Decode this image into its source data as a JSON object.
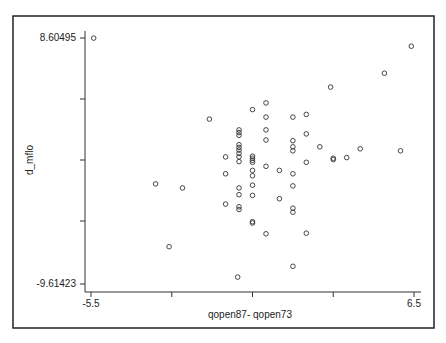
{
  "chart_data": {
    "type": "scatter",
    "title": "",
    "xlabel": "qopen87- qopen73",
    "ylabel": "d_mflo",
    "xlim": [
      -5.5,
      6.5
    ],
    "ylim": [
      -9.61423,
      8.60495
    ],
    "x_tick_labels": [
      "-5.5",
      "6.5"
    ],
    "x_ticks": [
      -5.5,
      -2.5,
      0.5,
      3.5,
      6.5
    ],
    "y_tick_labels": [
      "8.60495",
      "-9.61423"
    ],
    "y_ticks": [
      8.60495,
      4.05,
      -0.5,
      -5.06,
      -9.61423
    ],
    "grid": false,
    "legend": null,
    "marker": "hollow circle",
    "points": [
      {
        "x": -5.4,
        "y": 8.6
      },
      {
        "x": 6.4,
        "y": 8.0
      },
      {
        "x": 5.4,
        "y": 6.0
      },
      {
        "x": 3.4,
        "y": 4.97
      },
      {
        "x": -1.1,
        "y": 2.6
      },
      {
        "x": -3.1,
        "y": -2.2
      },
      {
        "x": -2.1,
        "y": -2.5
      },
      {
        "x": -2.6,
        "y": -6.85
      },
      {
        "x": 1.0,
        "y": 3.8
      },
      {
        "x": 0.5,
        "y": 3.3
      },
      {
        "x": 1.0,
        "y": 2.75
      },
      {
        "x": 2.0,
        "y": 2.75
      },
      {
        "x": 2.5,
        "y": 2.95
      },
      {
        "x": 0.0,
        "y": 1.8
      },
      {
        "x": 0.0,
        "y": 1.6
      },
      {
        "x": 0.0,
        "y": 1.4
      },
      {
        "x": 1.0,
        "y": 1.8
      },
      {
        "x": 1.0,
        "y": 1.05
      },
      {
        "x": 0.0,
        "y": 0.7
      },
      {
        "x": 0.0,
        "y": 0.5
      },
      {
        "x": 0.0,
        "y": 0.3
      },
      {
        "x": 0.0,
        "y": 0.05
      },
      {
        "x": 0.0,
        "y": -0.2
      },
      {
        "x": 0.0,
        "y": -0.55
      },
      {
        "x": -0.5,
        "y": -0.2
      },
      {
        "x": 0.5,
        "y": -0.15
      },
      {
        "x": 0.5,
        "y": -0.3
      },
      {
        "x": 0.5,
        "y": -0.45
      },
      {
        "x": 0.5,
        "y": -0.6
      },
      {
        "x": 1.0,
        "y": -0.9
      },
      {
        "x": 1.5,
        "y": -1.2
      },
      {
        "x": -0.5,
        "y": -1.45
      },
      {
        "x": 0.5,
        "y": -1.2
      },
      {
        "x": 0.5,
        "y": -1.6
      },
      {
        "x": 2.0,
        "y": 1.0
      },
      {
        "x": 2.0,
        "y": 0.55
      },
      {
        "x": 2.0,
        "y": 0.25
      },
      {
        "x": 2.0,
        "y": -1.45
      },
      {
        "x": 2.5,
        "y": -0.6
      },
      {
        "x": 2.5,
        "y": 1.5
      },
      {
        "x": 3.0,
        "y": 0.55
      },
      {
        "x": 3.5,
        "y": -0.4
      },
      {
        "x": 3.5,
        "y": -0.3
      },
      {
        "x": 4.0,
        "y": -0.25
      },
      {
        "x": 4.5,
        "y": 0.4
      },
      {
        "x": 6.0,
        "y": 0.25
      },
      {
        "x": 0.5,
        "y": -2.3
      },
      {
        "x": 2.0,
        "y": -2.35
      },
      {
        "x": 0.0,
        "y": -2.5
      },
      {
        "x": 0.0,
        "y": -3.0
      },
      {
        "x": 0.5,
        "y": -3.05
      },
      {
        "x": -0.5,
        "y": -3.7
      },
      {
        "x": 0.0,
        "y": -3.9
      },
      {
        "x": 0.0,
        "y": -4.1
      },
      {
        "x": 1.5,
        "y": -3.3
      },
      {
        "x": 2.0,
        "y": -4.0
      },
      {
        "x": 2.0,
        "y": -4.3
      },
      {
        "x": 0.5,
        "y": -5.0
      },
      {
        "x": 0.5,
        "y": -5.1
      },
      {
        "x": 1.0,
        "y": -5.9
      },
      {
        "x": 2.5,
        "y": -5.85
      },
      {
        "x": 2.0,
        "y": -8.3
      },
      {
        "x": -0.05,
        "y": -9.1
      }
    ]
  }
}
